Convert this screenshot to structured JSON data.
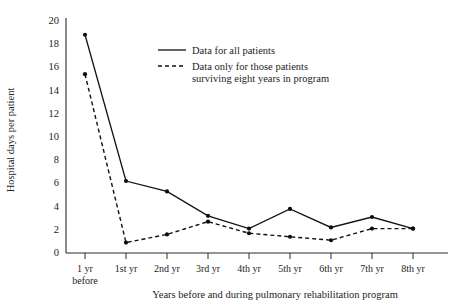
{
  "chart_data": {
    "type": "line",
    "title": "",
    "xlabel": "Years before and during pulmonary rehabilitation program",
    "ylabel": "Hospital days per patient",
    "categories": [
      "1 yr before",
      "1st yr",
      "2nd yr",
      "3rd yr",
      "4th yr",
      "5th yr",
      "6th yr",
      "7th yr",
      "8th yr"
    ],
    "x_tick_labels": [
      {
        "line1": "1 yr",
        "line2": "before"
      },
      {
        "line1": "1st yr",
        "line2": ""
      },
      {
        "line1": "2nd yr",
        "line2": ""
      },
      {
        "line1": "3rd yr",
        "line2": ""
      },
      {
        "line1": "4th yr",
        "line2": ""
      },
      {
        "line1": "5th yr",
        "line2": ""
      },
      {
        "line1": "6th yr",
        "line2": ""
      },
      {
        "line1": "7th yr",
        "line2": ""
      },
      {
        "line1": "8th yr",
        "line2": ""
      }
    ],
    "y_tick_labels": [
      "20",
      "18",
      "16",
      "14",
      "12",
      "10",
      "8",
      "6",
      "4",
      "2",
      "0"
    ],
    "y_tick_values": [
      20,
      18,
      16,
      14,
      12,
      10,
      8,
      6,
      4,
      2,
      0
    ],
    "ylim": [
      0,
      20
    ],
    "grid": false,
    "legend_position": "upper-center",
    "series": [
      {
        "name": "Data for all patients",
        "style": "solid",
        "values": [
          18.8,
          6.2,
          5.3,
          3.2,
          2.1,
          3.8,
          2.2,
          3.1,
          2.1
        ]
      },
      {
        "name": "Data only for those patients surviving eight years in program",
        "style": "dashed",
        "values": [
          15.4,
          0.9,
          1.6,
          2.7,
          1.7,
          1.4,
          1.1,
          2.1,
          2.1
        ]
      }
    ],
    "legend": [
      {
        "label_line1": "Data for all patients",
        "label_line2": "",
        "style": "solid"
      },
      {
        "label_line1": "Data only for those patients",
        "label_line2": "surviving eight years in program",
        "style": "dashed"
      }
    ],
    "colors": {
      "series_line": "#121212",
      "axis": "#2b2b2b",
      "text": "#242424",
      "background": "#ffffff"
    }
  }
}
